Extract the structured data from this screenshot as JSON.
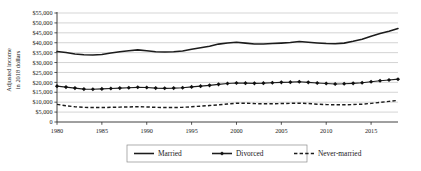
{
  "chart_data": {
    "type": "line",
    "title": "",
    "xlabel": "",
    "ylabel": "Adjusted income in 2018 dollars",
    "ylabel_line1": "Adjusted income",
    "ylabel_line2": "in 2018 dollars",
    "xlim": [
      1980,
      2018
    ],
    "ylim": [
      0,
      55000
    ],
    "ytick_step": 5000,
    "xtick_step": 5,
    "grid": true,
    "legend_position": "bottom",
    "ytick_labels": [
      "$55,000",
      "$50,000",
      "$45,000",
      "$40,000",
      "$35,000",
      "$30,000",
      "$25,000",
      "$20,000",
      "$15,000",
      "$10,000",
      "$5,000",
      "0"
    ],
    "ytick_values": [
      55000,
      50000,
      45000,
      40000,
      35000,
      30000,
      25000,
      20000,
      15000,
      10000,
      5000,
      0
    ],
    "xtick_labels": [
      "1980",
      "1985",
      "1990",
      "1995",
      "2000",
      "2005",
      "2010",
      "2015"
    ],
    "xtick_values": [
      1980,
      1985,
      1990,
      1995,
      2000,
      2005,
      2010,
      2015
    ],
    "x": [
      1980,
      1981,
      1982,
      1983,
      1984,
      1985,
      1986,
      1987,
      1988,
      1989,
      1990,
      1991,
      1992,
      1993,
      1994,
      1995,
      1996,
      1997,
      1998,
      1999,
      2000,
      2001,
      2002,
      2003,
      2004,
      2005,
      2006,
      2007,
      2008,
      2009,
      2010,
      2011,
      2012,
      2013,
      2014,
      2015,
      2016,
      2017,
      2018
    ],
    "series": [
      {
        "name": "Married",
        "style": "solid",
        "marker": "none",
        "color": "#1c1c1c",
        "values": [
          35600,
          35100,
          34300,
          33900,
          33800,
          34100,
          34800,
          35500,
          35900,
          36400,
          36000,
          35500,
          35300,
          35400,
          35800,
          36700,
          37500,
          38200,
          39300,
          39900,
          40200,
          39800,
          39400,
          39400,
          39600,
          39800,
          40100,
          40600,
          40200,
          39900,
          39600,
          39500,
          39800,
          40700,
          41800,
          43300,
          44600,
          45800,
          47200
        ]
      },
      {
        "name": "Divorced",
        "style": "solid",
        "marker": "diamond",
        "color": "#1c1c1c",
        "values": [
          18100,
          17600,
          17100,
          16600,
          16500,
          16700,
          16900,
          17100,
          17300,
          17500,
          17400,
          17100,
          17000,
          17100,
          17300,
          17700,
          18100,
          18500,
          19000,
          19400,
          19700,
          19600,
          19500,
          19600,
          19800,
          20000,
          20100,
          20300,
          20000,
          19700,
          19400,
          19200,
          19300,
          19500,
          19800,
          20300,
          20800,
          21200,
          21600
        ]
      },
      {
        "name": "Never-married",
        "style": "dashed",
        "marker": "none",
        "color": "#1c1c1c",
        "values": [
          8900,
          8200,
          7700,
          7400,
          7300,
          7300,
          7400,
          7500,
          7600,
          7700,
          7600,
          7400,
          7300,
          7300,
          7400,
          7700,
          8000,
          8300,
          8700,
          9100,
          9500,
          9500,
          9300,
          9200,
          9200,
          9300,
          9400,
          9500,
          9300,
          9000,
          8800,
          8700,
          8700,
          8800,
          9000,
          9400,
          9900,
          10400,
          10900
        ]
      }
    ],
    "legend": [
      {
        "label": "Married",
        "style": "solid",
        "marker": "none"
      },
      {
        "label": "Divorced",
        "style": "solid",
        "marker": "diamond"
      },
      {
        "label": "Never-married",
        "style": "dashed",
        "marker": "none"
      }
    ]
  }
}
